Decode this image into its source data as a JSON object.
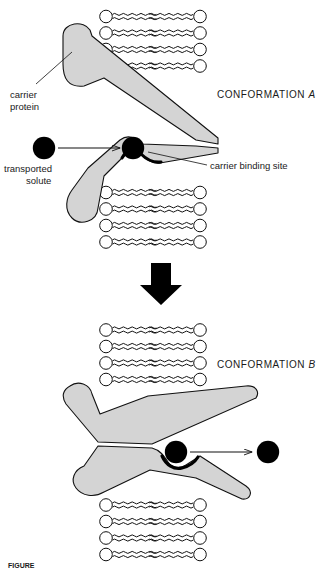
{
  "figure": {
    "title_hidden": "",
    "labels": {
      "carrier_protein_line1": "carrier",
      "carrier_protein_line2": "protein",
      "transported_solute_line1": "transported",
      "transported_solute_line2": "solute",
      "carrier_binding_site": "carrier binding site",
      "conformation_a_prefix": "CONFORMATION ",
      "conformation_a_letter": "A",
      "conformation_b_prefix": "CONFORMATION ",
      "conformation_b_letter": "B"
    },
    "caption": {
      "figure_number": "FIGURE",
      "text": ""
    },
    "colors": {
      "protein_fill": "#d4d4d4",
      "protein_stroke": "#111111",
      "solute_fill": "#000000",
      "lipid_head_fill": "#ffffff",
      "lipid_stroke": "#111111",
      "arrow_fill": "#000000",
      "background": "#ffffff",
      "text": "#1a1a1a"
    },
    "panels": [
      {
        "name": "conformation-a",
        "conformation": "A",
        "solute_state": "entering",
        "bilayer_rows": 4,
        "lipids_per_row": 2,
        "solute_count": 2
      },
      {
        "name": "conformation-b",
        "conformation": "B",
        "solute_state": "exiting",
        "bilayer_rows": 4,
        "lipids_per_row": 2,
        "solute_count": 2
      }
    ],
    "transition_arrow": {
      "direction": "down",
      "style": "solid-block"
    }
  }
}
